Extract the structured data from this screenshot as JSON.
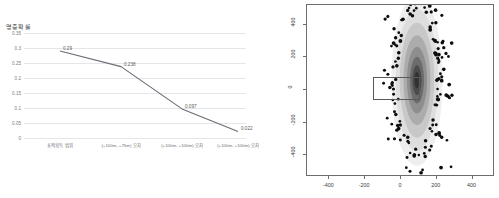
{
  "chart_data": [
    {
      "type": "line",
      "id": "hit-probability-line",
      "title": "",
      "ylabel": "명중확률",
      "xlabel": "",
      "categories": [
        "표적획득 범위",
        "(+100m, +75m) 오차",
        "(+100m, +100m) 오차",
        "(+100m, +100m) 오차"
      ],
      "values": [
        0.29,
        0.238,
        0.097,
        0.022
      ],
      "point_labels": [
        "0.29",
        "0.238",
        "0.097",
        "0.022"
      ],
      "ylim": [
        0,
        0.35
      ],
      "yticks": [
        "0",
        "0.05",
        "0.1",
        "0.15",
        "0.2",
        "0.25",
        "0.3",
        "0.35"
      ],
      "ytick_values": [
        0,
        0.05,
        0.1,
        0.15,
        0.2,
        0.25,
        0.3,
        0.35
      ],
      "grid": true,
      "legend": "none",
      "line_color": "#6b6b72"
    },
    {
      "type": "scatter",
      "id": "impact-dispersion-scatter",
      "title": "",
      "xlabel": "",
      "ylabel": "",
      "xlim": [
        -520,
        520
      ],
      "ylim": [
        -520,
        520
      ],
      "xticks": [
        "-400",
        "-200",
        "0",
        "200",
        "400"
      ],
      "xtick_values": [
        -400,
        -200,
        0,
        200,
        400
      ],
      "yticks": [
        "400",
        "200",
        "0",
        "-200",
        "-400"
      ],
      "ytick_values": [
        400,
        200,
        0,
        -200,
        -400
      ],
      "grid": false,
      "legend": "none",
      "density_center": [
        95,
        60
      ],
      "density_sigma_x": 70,
      "density_sigma_y": 255,
      "point_color": "#0d0d0d",
      "annotation_rect": {
        "x0": -150,
        "y0": -62,
        "x1": 112,
        "y1": 78,
        "stroke": "#595959"
      }
    }
  ]
}
